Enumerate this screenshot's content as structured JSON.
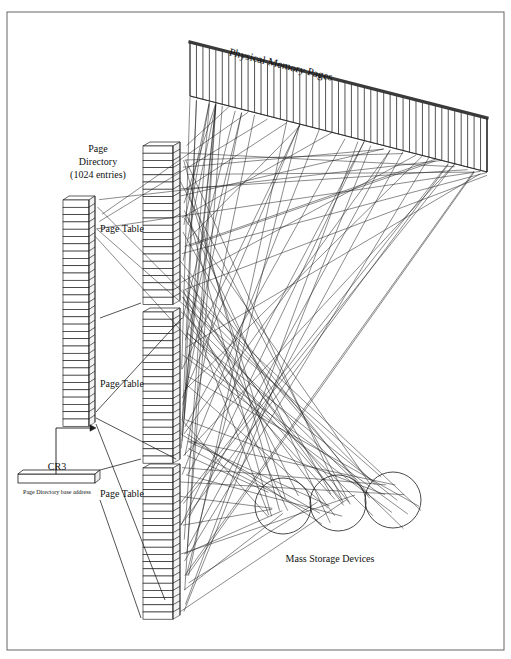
{
  "figure": {
    "border": {
      "x": 7,
      "y": 12,
      "width": 497,
      "height": 638
    },
    "background": "#ffffff",
    "ink": "#1a1a1a"
  },
  "labels": {
    "physical_memory": "Physical Memory Pages",
    "page_directory_line1": "Page",
    "page_directory_line2": "Directory",
    "page_directory_line3": "(1024  entries)",
    "page_table_1": "Page Table",
    "page_table_2": "Page Table",
    "page_table_3": "Page Table",
    "cr3": "CR3",
    "cr3_caption": "Page Directory base address",
    "mass_storage": "Mass Storage Devices"
  },
  "label_positions": {
    "physical_memory": {
      "x": 280,
      "y": 68,
      "rotate": 14,
      "size": 11
    },
    "page_directory": {
      "x": 98,
      "y": 152,
      "size": 10,
      "line_height": 13
    },
    "page_table_1": {
      "x": 100,
      "y": 232,
      "size": 10
    },
    "page_table_2": {
      "x": 100,
      "y": 387,
      "size": 10
    },
    "page_table_3": {
      "x": 100,
      "y": 497,
      "size": 10
    },
    "cr3": {
      "x": 57,
      "y": 470,
      "size": 10
    },
    "cr3_caption": {
      "x": 57,
      "y": 494,
      "size": 6
    },
    "mass_storage": {
      "x": 330,
      "y": 562,
      "size": 10
    }
  },
  "page_directory": {
    "x": 63,
    "y": 200,
    "cell_width": 26,
    "cell_height": 7.3,
    "cells": 31,
    "depth_x": 6,
    "depth_y": -4
  },
  "page_tables": [
    {
      "name": "page-table-top",
      "x": 143,
      "y": 146,
      "cell_width": 30,
      "cell_height": 7.2,
      "cells": 22,
      "depth_x": 7,
      "depth_y": -4
    },
    {
      "name": "page-table-middle",
      "x": 143,
      "y": 312,
      "cell_width": 30,
      "cell_height": 7.2,
      "cells": 21,
      "depth_x": 7,
      "depth_y": -4
    },
    {
      "name": "page-table-bottom",
      "x": 143,
      "y": 468,
      "cell_width": 30,
      "cell_height": 7.2,
      "cells": 21,
      "depth_x": 7,
      "depth_y": -4
    }
  ],
  "cr3_register": {
    "x": 18,
    "y": 474,
    "width": 77,
    "height": 9,
    "depth_x": 5,
    "depth_y": -4
  },
  "cr3_arrow": {
    "from_x": 56,
    "from_y": 474,
    "elbow_y": 428,
    "to_x": 96,
    "to_y": 428
  },
  "physical_memory_band": {
    "left_x": 190,
    "left_top_y": 42,
    "left_bottom_y": 96,
    "right_x": 487,
    "right_top_y": 118,
    "right_bottom_y": 172,
    "frames": 46,
    "top_edge_thickness": 3.2
  },
  "mass_storage_disks": [
    {
      "cx": 283,
      "cy": 506,
      "r": 28
    },
    {
      "cx": 338,
      "cy": 503,
      "r": 28
    },
    {
      "cx": 393,
      "cy": 500,
      "r": 28
    }
  ],
  "pointer_lines": [
    {
      "from_x": 100,
      "from_y": 318,
      "to_x": 141,
      "to_y": 303
    },
    {
      "from_x": 100,
      "from_y": 470,
      "to_x": 141,
      "to_y": 459
    },
    {
      "from_x": 100,
      "from_y": 500,
      "to_x": 141,
      "to_y": 618
    },
    {
      "from_x": 96,
      "from_y": 418,
      "to_x": 176,
      "to_y": 459
    },
    {
      "from_x": 96,
      "from_y": 424,
      "to_x": 165,
      "to_y": 600
    },
    {
      "from_x": 96,
      "from_y": 412,
      "to_x": 182,
      "to_y": 318
    }
  ],
  "mapping_web": {
    "description": "page-frame and disk mapping lines",
    "seed": 20240517,
    "to_memory_count": 58,
    "to_disk_count": 46,
    "source_x_jitter": 9,
    "stroke_width": 0.55
  },
  "chart_data": {
    "type": "diagram",
    "title": "Physical Memory Pages",
    "structures": [
      {
        "name": "Page Directory",
        "entries": 1024,
        "depicted_cells": 31
      },
      {
        "name": "Page Table",
        "instances": 3,
        "depicted_cells": 22
      },
      {
        "name": "Physical Memory Pages",
        "depicted_frames": 46
      },
      {
        "name": "Mass Storage Devices",
        "depicted_disks": 3
      },
      {
        "name": "CR3",
        "holds": "Page Directory base address"
      }
    ]
  }
}
